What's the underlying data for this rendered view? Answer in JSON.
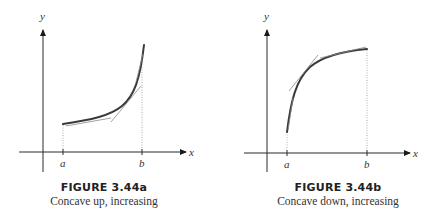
{
  "figures": [
    {
      "id": "3.44a",
      "title": "FIGURE 3.44a",
      "subtitle": "Concave up, increasing",
      "x_axis_label": "x",
      "y_axis_label": "y",
      "tick_labels": [
        "a",
        "b"
      ]
    },
    {
      "id": "3.44b",
      "title": "FIGURE 3.44b",
      "subtitle": "Concave down, increasing",
      "x_axis_label": "x",
      "y_axis_label": "y",
      "tick_labels": [
        "a",
        "b"
      ]
    }
  ],
  "colors": {
    "curve": "#3a3a3a",
    "axis": "#2a2a2a",
    "tangent": "#8a8a8a",
    "background": "#ffffff"
  }
}
